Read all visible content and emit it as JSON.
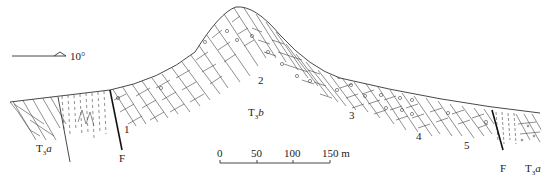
{
  "diagram": {
    "type": "geological-cross-section",
    "orientation_indicator": {
      "label": "10°",
      "icon": "dip-arrow-icon"
    },
    "formations": [
      {
        "id": "T3a_left",
        "symbol": "T",
        "subscript": "3",
        "suffix": "a"
      },
      {
        "id": "T3b",
        "symbol": "T",
        "subscript": "3",
        "suffix": "b"
      },
      {
        "id": "T3a_right",
        "symbol": "T",
        "subscript": "3",
        "suffix": "a"
      }
    ],
    "faults": [
      {
        "id": "fault_left",
        "label": "F"
      },
      {
        "id": "fault_right",
        "label": "F"
      }
    ],
    "beds": [
      {
        "label": "1"
      },
      {
        "label": "2"
      },
      {
        "label": "3"
      },
      {
        "label": "4"
      },
      {
        "label": "5"
      }
    ],
    "scale_bar": {
      "ticks": [
        "0",
        "50",
        "100",
        "150 m"
      ],
      "unit": "m"
    }
  }
}
